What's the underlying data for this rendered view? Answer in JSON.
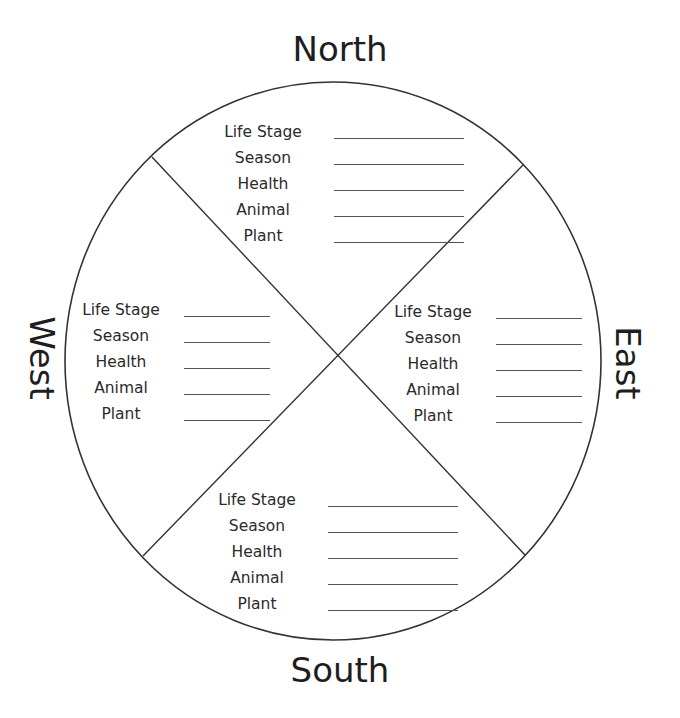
{
  "diagram": {
    "type": "medicine-wheel-worksheet",
    "directions": {
      "north": "North",
      "south": "South",
      "west": "West",
      "east": "East"
    },
    "quadrants": [
      {
        "id": "north",
        "fields": [
          {
            "label": "Life Stage",
            "value": ""
          },
          {
            "label": "Season",
            "value": ""
          },
          {
            "label": "Health",
            "value": ""
          },
          {
            "label": "Animal",
            "value": ""
          },
          {
            "label": "Plant",
            "value": ""
          }
        ]
      },
      {
        "id": "west",
        "fields": [
          {
            "label": "Life Stage",
            "value": ""
          },
          {
            "label": "Season",
            "value": ""
          },
          {
            "label": "Health",
            "value": ""
          },
          {
            "label": "Animal",
            "value": ""
          },
          {
            "label": "Plant",
            "value": ""
          }
        ]
      },
      {
        "id": "east",
        "fields": [
          {
            "label": "Life Stage",
            "value": ""
          },
          {
            "label": "Season",
            "value": ""
          },
          {
            "label": "Health",
            "value": ""
          },
          {
            "label": "Animal",
            "value": ""
          },
          {
            "label": "Plant",
            "value": ""
          }
        ]
      },
      {
        "id": "south",
        "fields": [
          {
            "label": "Life Stage",
            "value": ""
          },
          {
            "label": "Season",
            "value": ""
          },
          {
            "label": "Health",
            "value": ""
          },
          {
            "label": "Animal",
            "value": ""
          },
          {
            "label": "Plant",
            "value": ""
          }
        ]
      }
    ],
    "colors": {
      "stroke": "#333333",
      "text": "#222222",
      "background": "#ffffff"
    }
  }
}
